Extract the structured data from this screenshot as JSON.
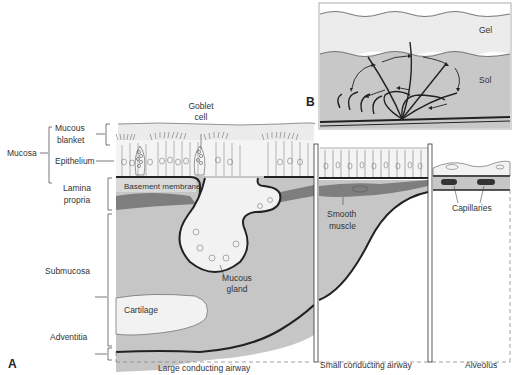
{
  "figure": {
    "panels": {
      "A": {
        "letter": "A",
        "left_labels": {
          "mucosa": "Mucosa",
          "mucous_blanket_1": "Mucous",
          "mucous_blanket_2": "blanket",
          "epithelium": "Epithelium",
          "lamina_propria_1": "Lamina",
          "lamina_propria_2": "propria",
          "submucosa": "Submucosa",
          "adventitia": "Adventitia"
        },
        "structure_labels": {
          "goblet_cell_1": "Goblet",
          "goblet_cell_2": "cell",
          "basement_membrane": "Basement membrane",
          "mucous_gland_1": "Mucous",
          "mucous_gland_2": "gland",
          "cartilage": "Cartilage",
          "smooth_muscle_1": "Smooth",
          "smooth_muscle_2": "muscle",
          "capillaries": "Capillaries"
        },
        "section_captions": {
          "large": "Large conducting airway",
          "small": "Small conducting airway",
          "alveolus": "Alveolus"
        }
      },
      "B": {
        "letter": "B",
        "layers": {
          "gel": "Gel",
          "sol": "Sol"
        }
      }
    },
    "colors": {
      "mucus": "#eaeaea",
      "tissue_gray": "#c4c4c4",
      "dark_band": "#7a7a7a",
      "cartilage": "#f2f2f2",
      "line": "#333333"
    }
  }
}
